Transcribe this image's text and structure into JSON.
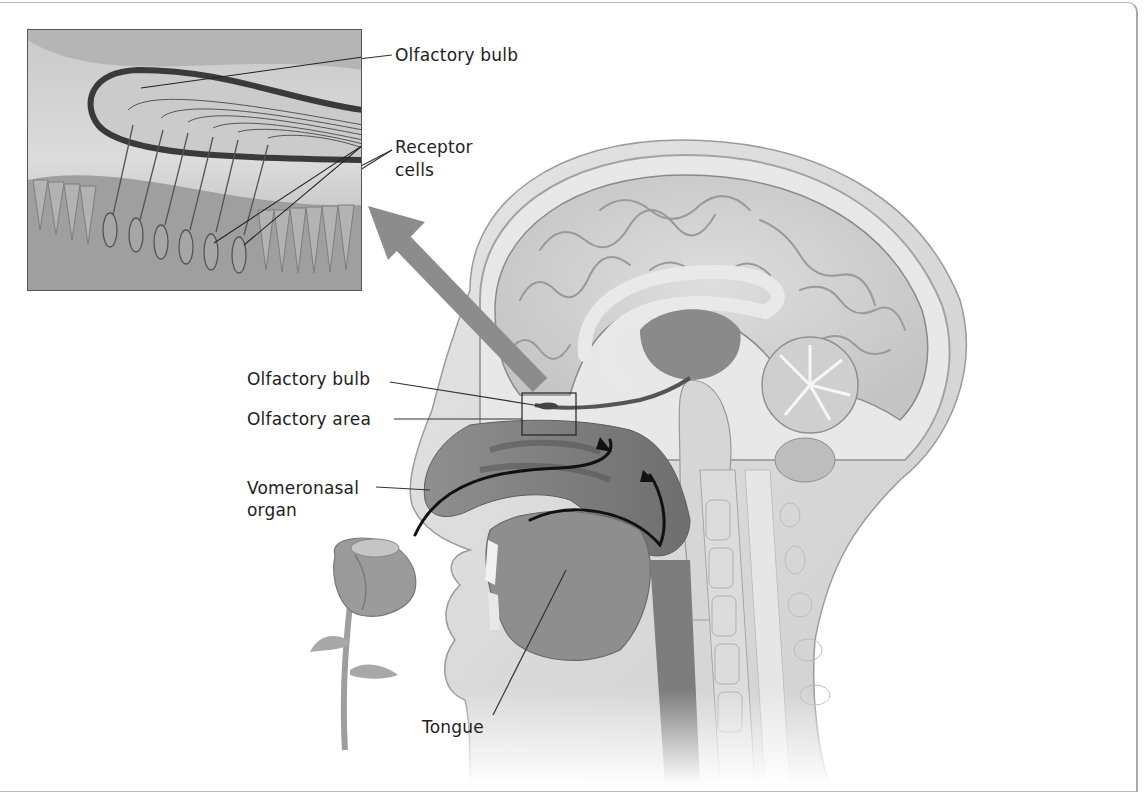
{
  "figure": {
    "inset_title": "Olfactory epithelium detail"
  },
  "labels": {
    "inset_olfactory_bulb": "Olfactory bulb",
    "receptor_line1": "Receptor",
    "receptor_line2": "cells",
    "olfactory_bulb": "Olfactory bulb",
    "olfactory_area": "Olfactory area",
    "vomeronasal_line1": "Vomeronasal",
    "vomeronasal_line2": "organ",
    "tongue": "Tongue"
  },
  "colors": {
    "background": "#ffffff",
    "label_text": "#222222",
    "leader_line": "#333333",
    "tissue_light": "#d9d9d9",
    "tissue_mid": "#a9a9a9",
    "tissue_dark": "#6f6f6f",
    "airflow_arrow": "#111111",
    "pointer_arrow": "#8c8c8c"
  }
}
